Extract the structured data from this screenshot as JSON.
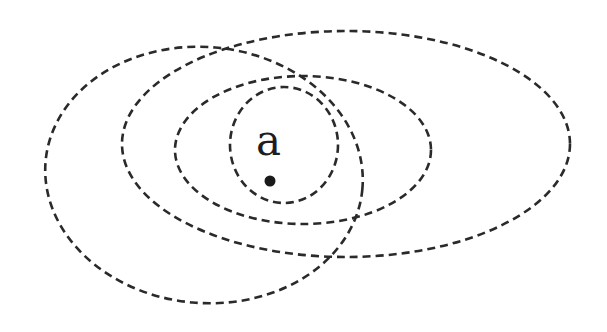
{
  "diagram": {
    "type": "nested-neighborhoods",
    "background": "#ffffff",
    "stroke_color": "#2a2a2a",
    "label": {
      "text": "a",
      "x": 256,
      "y": 155
    },
    "point": {
      "x": 270,
      "y": 181,
      "r": 5.5,
      "color": "#1a1a1a"
    },
    "ellipses": [
      {
        "id": "left-tilted",
        "cx": 204,
        "cy": 175,
        "rx": 159,
        "ry": 128,
        "rotate": 5
      },
      {
        "id": "large",
        "cx": 346,
        "cy": 144,
        "rx": 224,
        "ry": 113,
        "rotate": 0
      },
      {
        "id": "medium",
        "cx": 303,
        "cy": 150,
        "rx": 128,
        "ry": 74,
        "rotate": 0
      },
      {
        "id": "small",
        "cx": 284,
        "cy": 145,
        "rx": 54,
        "ry": 58,
        "rotate": 0
      }
    ]
  }
}
